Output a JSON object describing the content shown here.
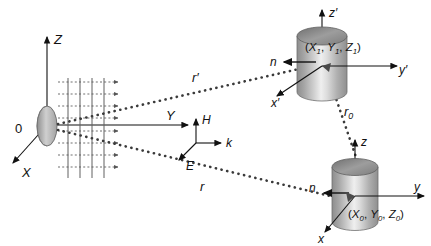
{
  "figure": {
    "background_color": "#ffffff",
    "line_color": "#111111",
    "wavefront_color": "#555555",
    "cylinder_light": "#e8e8e8",
    "cylinder_mid": "#bdbdbd",
    "cylinder_dark": "#8a8a8a",
    "cylinder_top": "#9a9a9a",
    "aperture_fill": "#b0b0b0"
  },
  "global_axes": {
    "origin_label": "0",
    "z_label": "Z",
    "y_label": "Y",
    "x_label": "X"
  },
  "field_triad": {
    "h_label": "H",
    "k_label": "k",
    "e_label": "E"
  },
  "rays": {
    "upper_label": "r",
    "upper_prime": "′",
    "lower_label": "r",
    "between_label": "r",
    "between_sub": "0"
  },
  "scatterer_upper": {
    "normal_label": "n",
    "axis_z_label": "z",
    "axis_z_prime": "′",
    "axis_y_label": "y",
    "axis_y_prime": "′",
    "axis_x_label": "x",
    "axis_x_prime": "′",
    "position_open": "(",
    "position_x": "X",
    "position_x_sub": "1",
    "position_comma1": ", ",
    "position_y": "Y",
    "position_y_sub": "1",
    "position_comma2": ", ",
    "position_z": "Z",
    "position_z_sub": "1",
    "position_close": ")"
  },
  "scatterer_lower": {
    "normal_label": "n",
    "axis_z_label": "z",
    "axis_y_label": "y",
    "axis_x_label": "x",
    "position_open": "(",
    "position_x": "X",
    "position_x_sub": "0",
    "position_comma1": ", ",
    "position_y": "Y",
    "position_y_sub": "0",
    "position_comma2": ", ",
    "position_z": "Z",
    "position_z_sub": "0",
    "position_close": ")"
  },
  "wavefronts": {
    "count": 4,
    "arrow_rows": 8,
    "description": "vertical plane-wave fronts with horizontal propagation arrows"
  }
}
